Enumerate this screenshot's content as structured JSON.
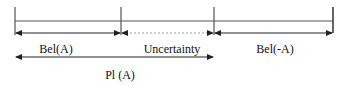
{
  "diagram": {
    "ticks_x": [
      15,
      121,
      214,
      333
    ],
    "labels": {
      "bel_a": "Bel(A)",
      "uncertainty": "Uncertainty",
      "bel_not_a": "Bel(-A)",
      "pl_a": "Pl (A)"
    },
    "segments": [
      {
        "name": "Bel(A)",
        "from": 15,
        "to": 121,
        "style": "solid"
      },
      {
        "name": "Uncertainty",
        "from": 121,
        "to": 214,
        "style": "dotted"
      },
      {
        "name": "Bel(-A)",
        "from": 214,
        "to": 333,
        "style": "solid"
      },
      {
        "name": "Pl (A)",
        "from": 15,
        "to": 214,
        "style": "solid"
      }
    ],
    "colors": {
      "line": "#222222",
      "dotted": "#888888"
    }
  }
}
